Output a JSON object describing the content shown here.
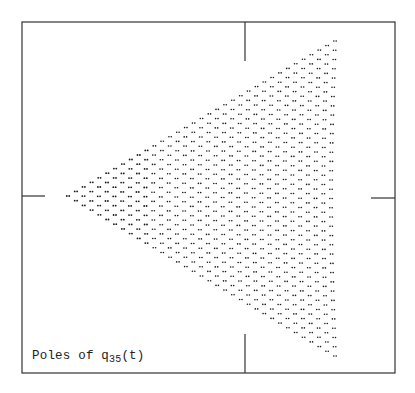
{
  "chart_data": {
    "type": "scatter",
    "title": "Poles of q35(t)",
    "caption": {
      "prefix": "Poles of q",
      "subscript": "35",
      "suffix": "(t)"
    },
    "xlabel": "",
    "ylabel": "",
    "grid": false,
    "legend": "none",
    "axis_ticks": [
      "top",
      "bottom",
      "left",
      "right"
    ],
    "n": 35,
    "shape": "triangular lattice of poles",
    "layout_px": {
      "frame": {
        "left": 22,
        "top": 22,
        "right": 395,
        "bottom": 373
      },
      "center_y": 197,
      "vertical_tick_x": 245,
      "left_vertex": [
        68,
        196
      ],
      "top_right_vertex": [
        335,
        41
      ],
      "bottom_right_vertex": [
        335,
        356
      ]
    },
    "colors": {
      "points": "#1a1a1a",
      "frame": "#333333"
    }
  }
}
